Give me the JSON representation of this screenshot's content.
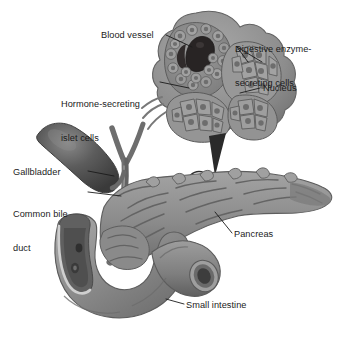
{
  "figure": {
    "background_color": "#ffffff",
    "label_color": "#1b1b1b",
    "leader_line_color": "#1b1b1b",
    "palette": {
      "organ_mid_gray": "#8e8e8e",
      "organ_dark_gray": "#6a6a6a",
      "organ_light_gray": "#b4b4b4",
      "gallbladder_dark": "#4e4e4e",
      "blood_vessel_black": "#241f1f",
      "cell_fill": "#9a9a9a",
      "nucleus_fill": "#707070",
      "outline": "#5a5a5a"
    }
  },
  "labels": {
    "blood_vessel": "Blood vessel",
    "digestive_line1": "Digestive enzyme-",
    "digestive_line2": "secreting cells",
    "hormone_line1": "Hormone-secreting",
    "hormone_line2": "islet cells",
    "nucleus": "Nucleus",
    "gallbladder": "Gallbladder",
    "common_bile_line1": "Common bile",
    "common_bile_line2": "duct",
    "pancreas": "Pancreas",
    "small_intestine": "Small intestine"
  },
  "structures": [
    {
      "name": "blood-vessel",
      "type": "inset-detail"
    },
    {
      "name": "digestive-enzyme-secreting-cells",
      "type": "inset-detail"
    },
    {
      "name": "hormone-secreting-islet-cells",
      "type": "inset-detail"
    },
    {
      "name": "nucleus",
      "type": "inset-detail"
    },
    {
      "name": "gallbladder",
      "type": "organ"
    },
    {
      "name": "common-bile-duct",
      "type": "duct"
    },
    {
      "name": "pancreas",
      "type": "organ"
    },
    {
      "name": "small-intestine",
      "type": "organ"
    }
  ]
}
